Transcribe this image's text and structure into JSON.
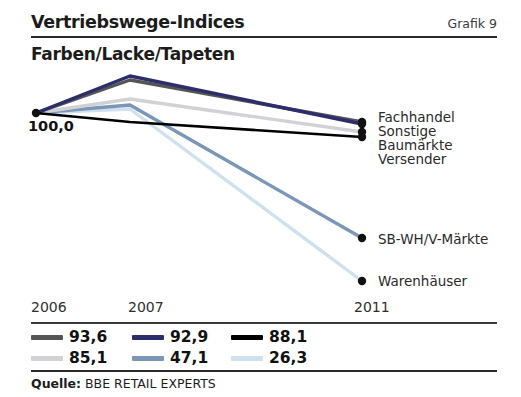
{
  "header": {
    "title": "Vertriebswege-Indices",
    "figure_label": "Grafik 9",
    "subtitle": "Farben/Lacke/Tapeten"
  },
  "source": {
    "label": "Quelle:",
    "value": "BBE RETAIL EXPERTS"
  },
  "chart_data": {
    "type": "line",
    "title": "Vertriebswege-Indices",
    "subtitle": "Farben/Lacke/Tapeten",
    "xlabel": "",
    "ylabel": "",
    "grid": false,
    "legend_position": "bottom",
    "base_value_label": "100,0",
    "x": [
      "2006",
      "2007",
      "2011"
    ],
    "xtick_labels": [
      "2006",
      "2007",
      "2011"
    ],
    "ylim": [
      0,
      115
    ],
    "series": [
      {
        "name": "Sonstige",
        "legend_value": "93,6",
        "color": "#555555",
        "values": [
          100.0,
          112.0,
          93.6
        ],
        "end_label": "Sonstige"
      },
      {
        "name": "Fachhandel",
        "legend_value": "92,9",
        "color": "#2d2d6b",
        "values": [
          100.0,
          114.0,
          92.9
        ],
        "end_label": "Fachhandel"
      },
      {
        "name": "Versender",
        "legend_value": "88,1",
        "color": "#000000",
        "values": [
          100.0,
          95.0,
          88.1
        ],
        "end_label": "Versender"
      },
      {
        "name": "Baumärkte",
        "legend_value": "85,1",
        "color": "#d2d2d6",
        "values": [
          100.0,
          106.0,
          85.1
        ],
        "end_label": "Baumärkte"
      },
      {
        "name": "SB-WH/V-Märkte",
        "legend_value": "47,1",
        "color": "#7a97b8",
        "values": [
          100.0,
          104.0,
          47.1
        ],
        "end_label": "SB-WH/V-Märkte"
      },
      {
        "name": "Warenhäuser",
        "legend_value": "26,3",
        "color": "#cfe0ef",
        "values": [
          100.0,
          102.0,
          26.3
        ],
        "end_label": "Warenhäuser"
      }
    ],
    "legend": [
      {
        "value": "93,6",
        "color": "#555555"
      },
      {
        "value": "92,9",
        "color": "#2d2d6b"
      },
      {
        "value": "88,1",
        "color": "#000000"
      },
      {
        "value": "85,1",
        "color": "#d2d2d6"
      },
      {
        "value": "47,1",
        "color": "#7a97b8"
      },
      {
        "value": "26,3",
        "color": "#cfe0ef"
      }
    ]
  },
  "geometry": {
    "points": {
      "start": {
        "x": 36,
        "y": 113
      },
      "mid_x": 130,
      "end_x": 362
    },
    "series_pixels": [
      {
        "name": "Sonstige",
        "mid_y": 80,
        "end_y": 122
      },
      {
        "name": "Fachhandel",
        "mid_y": 76,
        "end_y": 124
      },
      {
        "name": "Versender",
        "mid_y": 122,
        "end_y": 137
      },
      {
        "name": "Baumärkte",
        "mid_y": 99,
        "end_y": 132
      },
      {
        "name": "SB-WH/V-Märkte",
        "mid_y": 105,
        "end_y": 238
      },
      {
        "name": "Warenhäuser",
        "mid_y": 109,
        "end_y": 281
      }
    ],
    "xticks": [
      {
        "label": "2006",
        "x": 31
      },
      {
        "label": "2007",
        "x": 128
      },
      {
        "label": "2011",
        "x": 354
      }
    ],
    "end_labels": [
      {
        "label": "Fachhandel",
        "x": 378,
        "y": 109
      },
      {
        "label": "Sonstige",
        "x": 378,
        "y": 123
      },
      {
        "label": "Baumärkte",
        "x": 378,
        "y": 137
      },
      {
        "label": "Versender",
        "x": 378,
        "y": 151
      },
      {
        "label": "SB-WH/V-Märkte",
        "x": 378,
        "y": 231
      },
      {
        "label": "Warenhäuser",
        "x": 378,
        "y": 273
      }
    ],
    "legend_cells": [
      {
        "col": 0,
        "row": 0,
        "x": 0,
        "y": 0
      },
      {
        "col": 1,
        "row": 0,
        "x": 101,
        "y": 0
      },
      {
        "col": 2,
        "row": 0,
        "x": 200,
        "y": 0
      },
      {
        "col": 0,
        "row": 1,
        "x": 0,
        "y": 21
      },
      {
        "col": 1,
        "row": 1,
        "x": 101,
        "y": 21
      },
      {
        "col": 2,
        "row": 1,
        "x": 200,
        "y": 21
      }
    ]
  }
}
